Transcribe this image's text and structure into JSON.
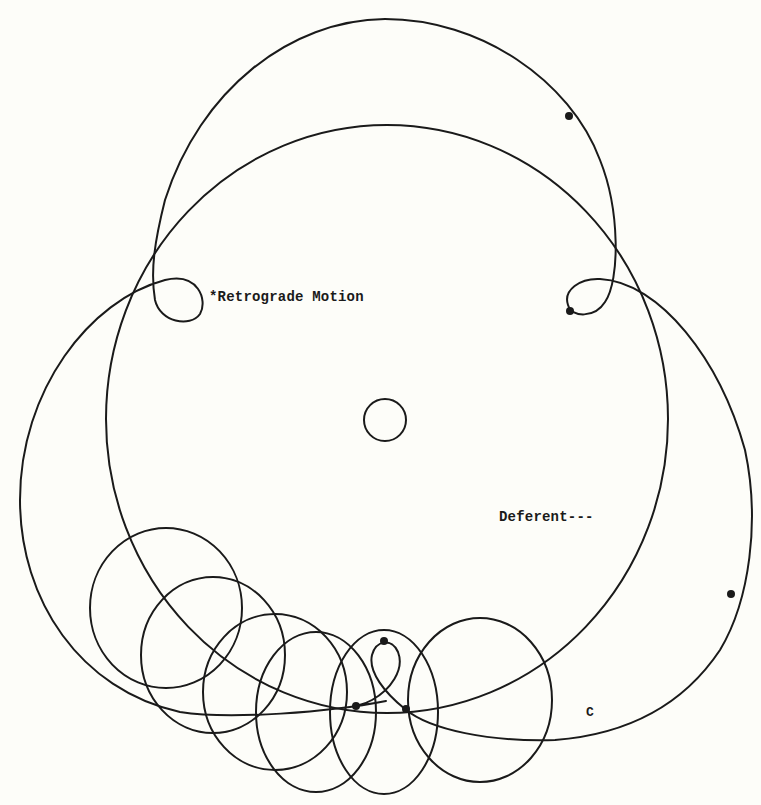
{
  "diagram": {
    "labels": {
      "retrograde": "*Retrograde Motion",
      "deferent": "Deferent---",
      "point_c": "C"
    },
    "colors": {
      "background": "#fdfdf9",
      "stroke": "#1a1a1a"
    },
    "elements": {
      "deferent_circle": {
        "cx": 387,
        "cy": 419,
        "rx": 281,
        "ry": 294
      },
      "center_body": {
        "cx": 385,
        "cy": 420,
        "r": 21
      },
      "epicycles": [
        {
          "cx": 166,
          "cy": 608,
          "rx": 76,
          "ry": 80
        },
        {
          "cx": 213,
          "cy": 655,
          "rx": 72,
          "ry": 78
        },
        {
          "cx": 275,
          "cy": 692,
          "rx": 72,
          "ry": 78
        },
        {
          "cx": 316,
          "cy": 712,
          "rx": 60,
          "ry": 80
        },
        {
          "cx": 384,
          "cy": 712,
          "rx": 54,
          "ry": 82
        },
        {
          "cx": 480,
          "cy": 700,
          "rx": 72,
          "ry": 82
        }
      ],
      "planet_positions": [
        {
          "x": 569,
          "y": 116
        },
        {
          "x": 570,
          "y": 311
        },
        {
          "x": 731,
          "y": 594
        },
        {
          "x": 384,
          "y": 641
        },
        {
          "x": 356,
          "y": 706
        },
        {
          "x": 406,
          "y": 709
        }
      ]
    }
  }
}
